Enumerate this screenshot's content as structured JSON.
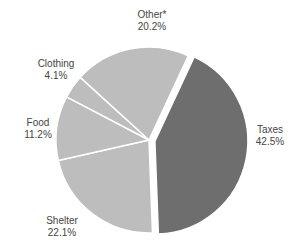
{
  "chart_data": {
    "type": "pie",
    "title": "",
    "categories": [
      "Taxes",
      "Shelter",
      "Food",
      "Clothing",
      "Other*"
    ],
    "values": [
      42.5,
      22.1,
      11.2,
      4.1,
      20.2
    ],
    "labels": [
      "42.5%",
      "22.1%",
      "11.2%",
      "4.1%",
      "20.2%"
    ],
    "colors": [
      "#6e6e6e",
      "#bdbdbd",
      "#bdbdbd",
      "#bdbdbd",
      "#bdbdbd"
    ],
    "exploded": [
      "Taxes"
    ],
    "legend": "none",
    "start_angle_deg": 25
  },
  "labels": {
    "other": {
      "name": "Other*",
      "pct": "20.2%"
    },
    "clothing": {
      "name": "Clothing",
      "pct": "4.1%"
    },
    "food": {
      "name": "Food",
      "pct": "11.2%"
    },
    "shelter": {
      "name": "Shelter",
      "pct": "22.1%"
    },
    "taxes": {
      "name": "Taxes",
      "pct": "42.5%"
    }
  }
}
